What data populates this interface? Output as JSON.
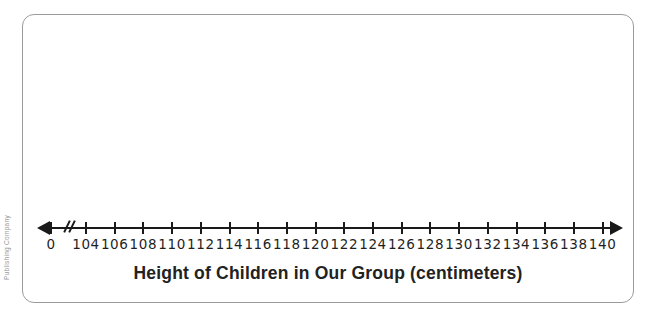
{
  "page": {
    "copyright_fragment": "Publishing Company"
  },
  "colors": {
    "axis": "#1a1a1a",
    "panel_border": "#9b9b9b",
    "title_text": "#222222",
    "copyright_text": "#999999",
    "background": "#ffffff"
  },
  "chart_data": {
    "type": "line",
    "subtype": "number_line_plot_template",
    "title": "Height of Children in Our Group (centimeters)",
    "xlabel": "Height of Children in Our Group (centimeters)",
    "ylabel": "",
    "tick_labels": [
      "0",
      "104",
      "106",
      "108",
      "110",
      "112",
      "114",
      "116",
      "118",
      "120",
      "122",
      "124",
      "126",
      "128",
      "130",
      "132",
      "134",
      "136",
      "138",
      "140"
    ],
    "tick_values": [
      0,
      104,
      106,
      108,
      110,
      112,
      114,
      116,
      118,
      120,
      122,
      124,
      126,
      128,
      130,
      132,
      134,
      136,
      138,
      140
    ],
    "tick_step": 2,
    "axis_break_between": [
      "0",
      "104"
    ],
    "shown_range": [
      104,
      140
    ],
    "arrows": "both-ends",
    "grid": false,
    "legend": false,
    "points": []
  }
}
